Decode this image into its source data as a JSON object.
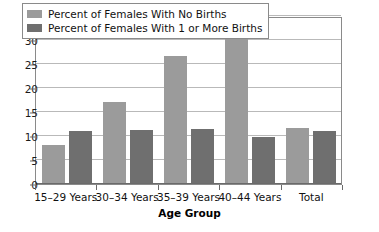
{
  "chart_data": {
    "type": "bar",
    "title": "",
    "xlabel": "Age Group",
    "ylabel": "",
    "ylim": [
      0,
      35
    ],
    "ytick_step": 5,
    "yticks": [
      0,
      5,
      10,
      15,
      20,
      25,
      30,
      35
    ],
    "grid": true,
    "legend_position": "top-left-inside",
    "categories": [
      "15–29 Years",
      "30–34 Years",
      "35–39 Years",
      "40–44 Years",
      "Total"
    ],
    "series": [
      {
        "name": "Percent of Females With No Births",
        "color": "#9b9b9b",
        "values": [
          8.1,
          17.1,
          26.7,
          30.6,
          11.6
        ]
      },
      {
        "name": "Percent of Females With 1 or More Births",
        "color": "#6f6f6f",
        "values": [
          11.0,
          11.2,
          11.5,
          9.7,
          11.0
        ]
      }
    ]
  },
  "colors": {
    "series_no_births": "#9b9b9b",
    "series_one_or_more_births": "#6f6f6f",
    "gridline": "#b9b9b9",
    "axis": "#6a6a6a",
    "frame": "#8a8a8a",
    "background": "#ffffff",
    "text": "#111111"
  }
}
